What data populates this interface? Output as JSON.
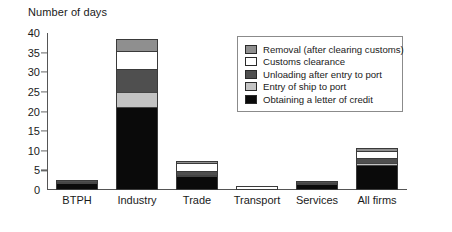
{
  "chart_data": {
    "type": "bar",
    "stacked": true,
    "title": "",
    "ylabel": "Number of days",
    "xlabel": "",
    "ylim": [
      0,
      40
    ],
    "yticks": [
      0,
      5,
      10,
      15,
      20,
      25,
      30,
      35,
      40
    ],
    "grid": false,
    "legend_position": "inside-top-right",
    "categories": [
      "BTPH",
      "Industry",
      "Trade",
      "Transport",
      "Services",
      "All firms"
    ],
    "series": [
      {
        "name": "Obtaining a letter of credit",
        "color": "#0a0a0a",
        "swatch": "black",
        "values": [
          1.8,
          21.0,
          3.2,
          0.0,
          1.6,
          6.0
        ]
      },
      {
        "name": "Entry of ship to port",
        "color": "#c3c3c3",
        "swatch": "lightgray",
        "values": [
          0.3,
          4.0,
          0.5,
          0.0,
          0.2,
          1.0
        ]
      },
      {
        "name": "Unloading after entry to port",
        "color": "#4f4f4f",
        "swatch": "darkgray",
        "values": [
          0.3,
          5.5,
          0.9,
          0.0,
          0.3,
          0.8
        ]
      },
      {
        "name": "Customs clearance",
        "color": "#ffffff",
        "swatch": "white",
        "values": [
          0.0,
          5.0,
          2.3,
          1.0,
          0.0,
          2.2
        ]
      },
      {
        "name": "Removal (after clearing customs)",
        "color": "#8f8f8f",
        "swatch": "medgray",
        "values": [
          0.2,
          3.0,
          0.6,
          0.0,
          0.2,
          0.8
        ]
      }
    ],
    "totals": [
      2.6,
      38.5,
      7.5,
      1.0,
      2.3,
      10.8
    ]
  },
  "legend": {
    "entries": [
      "Removal (after clearing customs)",
      "Customs clearance",
      "Unloading after entry to port",
      "Entry of ship to port",
      "Obtaining a letter of credit"
    ]
  }
}
